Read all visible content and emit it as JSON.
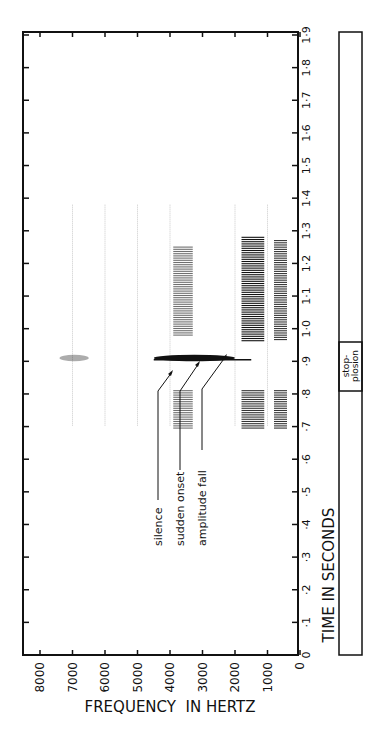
{
  "chart_data": {
    "type": "heatmap",
    "title": "",
    "subtitle": "Rotated sound spectrogram of a stop-plosion",
    "xlabel": "TIME IN SECONDS",
    "ylabel": "FREQUENCY IN HERTZ",
    "orientation": "rotated-90 (time runs bottom-to-top on the right axis, frequency runs right-to-left on the bottom axis)",
    "time_axis": {
      "label": "TIME IN SECONDS",
      "range": [
        0,
        1.9
      ],
      "ticks": [
        "0",
        "·1",
        "·2",
        "·3",
        "·4",
        "·5",
        "·6",
        "·7",
        "·8",
        "·9",
        "1·0",
        "1·1",
        "1·2",
        "1·3",
        "1·4",
        "1·5",
        "1·6",
        "1·7",
        "1·8",
        "1·9"
      ]
    },
    "frequency_axis": {
      "label": "FREQUENCY IN HERTZ",
      "range": [
        0,
        8000
      ],
      "ticks": [
        "8000",
        "7000",
        "6000",
        "5000",
        "4000",
        "3000",
        "2000",
        "1000",
        "0"
      ]
    },
    "grid": "faint vertical lines at 1000 Hz intervals between 0.7 s and 1.4 s",
    "energy_regions": [
      {
        "name": "pre-closure vowel F1",
        "freq_hz": [
          400,
          800
        ],
        "time_s": [
          0.69,
          0.81
        ],
        "intensity": "strong"
      },
      {
        "name": "pre-closure vowel F2",
        "freq_hz": [
          1100,
          1800
        ],
        "time_s": [
          0.69,
          0.81
        ],
        "intensity": "strong"
      },
      {
        "name": "pre-closure vowel F3",
        "freq_hz": [
          3300,
          3900
        ],
        "time_s": [
          0.69,
          0.81
        ],
        "intensity": "medium"
      },
      {
        "name": "plosion burst",
        "freq_hz": [
          2000,
          4500
        ],
        "time_s": [
          0.9,
          0.92
        ],
        "intensity": "very strong"
      },
      {
        "name": "burst high-frequency trace",
        "freq_hz": [
          6500,
          7400
        ],
        "time_s": [
          0.9,
          0.92
        ],
        "intensity": "weak"
      },
      {
        "name": "post-release vowel F1",
        "freq_hz": [
          400,
          800
        ],
        "time_s": [
          0.96,
          1.27
        ],
        "intensity": "strong"
      },
      {
        "name": "post-release vowel F2",
        "freq_hz": [
          1100,
          1800
        ],
        "time_s": [
          0.96,
          1.28
        ],
        "intensity": "very strong"
      },
      {
        "name": "post-release vowel F3",
        "freq_hz": [
          3300,
          3900
        ],
        "time_s": [
          0.98,
          1.25
        ],
        "intensity": "medium"
      }
    ],
    "annotations": [
      {
        "text": "silence",
        "points_to_time_s": 0.86,
        "points_to_freq_hz": 3900
      },
      {
        "text": "sudden onset",
        "points_to_time_s": 0.9,
        "points_to_freq_hz": 3100
      },
      {
        "text": "amplitude fall",
        "points_to_time_s": 0.92,
        "points_to_freq_hz": 2200
      }
    ],
    "segment_bar": {
      "segments": [
        {
          "label": "",
          "time_s": [
            0,
            0.82
          ]
        },
        {
          "label": "stop-plosion",
          "time_s": [
            0.82,
            0.97
          ]
        },
        {
          "label": "",
          "time_s": [
            0.97,
            1.9
          ]
        }
      ]
    },
    "legend": null
  },
  "labels": {
    "x_axis_title": "FREQUENCY  IN HERTZ",
    "y_axis_title": "TIME IN SECONDS",
    "segment_label_line1": "stop-",
    "segment_label_line2": "plosion",
    "annotation_silence": "silence",
    "annotation_onset": "sudden onset",
    "annotation_fall": "amplitude fall"
  },
  "colors": {
    "ink": "#111111",
    "background": "#ffffff",
    "grid": "#bdbdbd"
  }
}
